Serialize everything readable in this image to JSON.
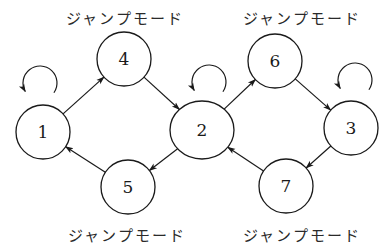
{
  "diagram": {
    "type": "state-transition-graph",
    "nodes": [
      {
        "id": "1",
        "label": "1"
      },
      {
        "id": "2",
        "label": "2"
      },
      {
        "id": "3",
        "label": "3"
      },
      {
        "id": "4",
        "label": "4"
      },
      {
        "id": "5",
        "label": "5"
      },
      {
        "id": "6",
        "label": "6"
      },
      {
        "id": "7",
        "label": "7"
      }
    ],
    "edges": [
      {
        "from": "1",
        "to": "4"
      },
      {
        "from": "4",
        "to": "2"
      },
      {
        "from": "2",
        "to": "5"
      },
      {
        "from": "5",
        "to": "1"
      },
      {
        "from": "2",
        "to": "6"
      },
      {
        "from": "6",
        "to": "3"
      },
      {
        "from": "3",
        "to": "7"
      },
      {
        "from": "7",
        "to": "2"
      }
    ],
    "self_loops": [
      "1",
      "2",
      "3"
    ],
    "mode_labels": [
      {
        "text": "ジャンプモード",
        "attached_to": "4"
      },
      {
        "text": "ジャンプモード",
        "attached_to": "6"
      },
      {
        "text": "ジャンプモード",
        "attached_to": "5"
      },
      {
        "text": "ジャンプモード",
        "attached_to": "7"
      }
    ]
  }
}
